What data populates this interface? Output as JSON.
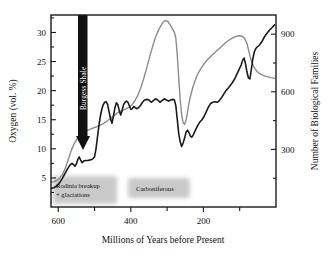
{
  "chart_data": {
    "type": "line",
    "title": "",
    "xlabel": "Millions of Years before Present",
    "ylabel": "Oxygen (vol. %)",
    "y2label": "Number of Biological Families",
    "xlim": [
      620,
      0
    ],
    "ylim": [
      0,
      33
    ],
    "y2lim": [
      0,
      1000
    ],
    "x_ticks": [
      600,
      400,
      200
    ],
    "x_tick_labels": [
      "600",
      "400",
      "200"
    ],
    "x_minor_ticks": [
      500,
      300,
      100
    ],
    "y_ticks": [
      5,
      10,
      15,
      20,
      25,
      30
    ],
    "y_tick_labels": [
      "5",
      "10",
      "15",
      "20",
      "25",
      "30"
    ],
    "y2_ticks": [
      300,
      600,
      900
    ],
    "y2_tick_labels": [
      "300",
      "600",
      "900"
    ],
    "y2_minor_ticks": [
      150,
      450,
      750,
      1050
    ],
    "grid": false,
    "legend_position": "none",
    "series": [
      {
        "name": "Oxygen (vol. %)",
        "axis": "left",
        "color": "#1a1a1a",
        "width": 1.6,
        "points": [
          [
            620,
            3.2
          ],
          [
            612,
            3.3
          ],
          [
            604,
            3.6
          ],
          [
            596,
            4.2
          ],
          [
            588,
            5.0
          ],
          [
            580,
            5.9
          ],
          [
            574,
            6.6
          ],
          [
            568,
            7.2
          ],
          [
            562,
            7.5
          ],
          [
            558,
            7.3
          ],
          [
            554,
            7.0
          ],
          [
            550,
            7.4
          ],
          [
            546,
            8.2
          ],
          [
            542,
            8.6
          ],
          [
            538,
            8.0
          ],
          [
            534,
            7.6
          ],
          [
            530,
            7.9
          ],
          [
            524,
            8.0
          ],
          [
            518,
            8.0
          ],
          [
            512,
            8.1
          ],
          [
            506,
            8.2
          ],
          [
            500,
            8.6
          ],
          [
            496,
            10.0
          ],
          [
            492,
            12.0
          ],
          [
            488,
            14.0
          ],
          [
            484,
            15.6
          ],
          [
            480,
            16.8
          ],
          [
            476,
            17.6
          ],
          [
            472,
            18.0
          ],
          [
            468,
            18.1
          ],
          [
            464,
            17.6
          ],
          [
            460,
            16.4
          ],
          [
            456,
            15.2
          ],
          [
            452,
            14.4
          ],
          [
            448,
            15.6
          ],
          [
            444,
            17.0
          ],
          [
            440,
            17.9
          ],
          [
            436,
            17.6
          ],
          [
            432,
            16.6
          ],
          [
            428,
            15.8
          ],
          [
            424,
            16.6
          ],
          [
            420,
            17.6
          ],
          [
            416,
            18.0
          ],
          [
            412,
            18.2
          ],
          [
            408,
            18.0
          ],
          [
            404,
            17.4
          ],
          [
            400,
            16.8
          ],
          [
            396,
            16.9
          ],
          [
            392,
            17.3
          ],
          [
            388,
            17.1
          ],
          [
            384,
            16.9
          ],
          [
            380,
            17.0
          ],
          [
            374,
            17.4
          ],
          [
            368,
            18.0
          ],
          [
            362,
            18.4
          ],
          [
            356,
            18.5
          ],
          [
            350,
            18.4
          ],
          [
            344,
            18.0
          ],
          [
            338,
            18.3
          ],
          [
            332,
            18.6
          ],
          [
            326,
            18.4
          ],
          [
            320,
            18.0
          ],
          [
            314,
            18.3
          ],
          [
            308,
            18.6
          ],
          [
            302,
            18.4
          ],
          [
            296,
            18.2
          ],
          [
            290,
            18.4
          ],
          [
            284,
            18.5
          ],
          [
            280,
            18.4
          ],
          [
            276,
            17.4
          ],
          [
            272,
            15.0
          ],
          [
            268,
            12.6
          ],
          [
            264,
            11.2
          ],
          [
            260,
            10.4
          ],
          [
            256,
            11.0
          ],
          [
            252,
            11.8
          ],
          [
            248,
            12.8
          ],
          [
            244,
            13.2
          ],
          [
            240,
            12.8
          ],
          [
            236,
            12.2
          ],
          [
            232,
            12.0
          ],
          [
            228,
            12.4
          ],
          [
            222,
            13.2
          ],
          [
            216,
            14.0
          ],
          [
            210,
            14.6
          ],
          [
            204,
            15.0
          ],
          [
            198,
            15.6
          ],
          [
            192,
            16.4
          ],
          [
            186,
            17.2
          ],
          [
            180,
            17.8
          ],
          [
            174,
            18.0
          ],
          [
            168,
            18.1
          ],
          [
            162,
            18.0
          ],
          [
            156,
            18.3
          ],
          [
            150,
            18.8
          ],
          [
            144,
            19.4
          ],
          [
            138,
            20.0
          ],
          [
            132,
            20.4
          ],
          [
            126,
            20.9
          ],
          [
            120,
            21.4
          ],
          [
            114,
            22.0
          ],
          [
            108,
            22.8
          ],
          [
            102,
            23.6
          ],
          [
            96,
            24.4
          ],
          [
            92,
            25.2
          ],
          [
            88,
            25.6
          ],
          [
            84,
            24.6
          ],
          [
            80,
            23.2
          ],
          [
            76,
            22.2
          ],
          [
            72,
            22.0
          ],
          [
            68,
            23.6
          ],
          [
            64,
            25.4
          ],
          [
            60,
            26.6
          ],
          [
            56,
            27.2
          ],
          [
            52,
            27.5
          ],
          [
            46,
            27.8
          ],
          [
            40,
            28.3
          ],
          [
            34,
            29.0
          ],
          [
            28,
            29.6
          ],
          [
            22,
            30.1
          ],
          [
            16,
            30.5
          ],
          [
            10,
            30.9
          ],
          [
            4,
            31.3
          ]
        ]
      },
      {
        "name": "Number of Biological Families",
        "axis": "right",
        "color": "#8c8c8c",
        "width": 1.4,
        "points": [
          [
            620,
            130
          ],
          [
            612,
            132
          ],
          [
            604,
            138
          ],
          [
            596,
            150
          ],
          [
            588,
            170
          ],
          [
            580,
            205
          ],
          [
            572,
            250
          ],
          [
            564,
            295
          ],
          [
            556,
            330
          ],
          [
            548,
            355
          ],
          [
            540,
            375
          ],
          [
            532,
            388
          ],
          [
            524,
            396
          ],
          [
            516,
            402
          ],
          [
            508,
            408
          ],
          [
            500,
            414
          ],
          [
            492,
            420
          ],
          [
            484,
            426
          ],
          [
            476,
            434
          ],
          [
            468,
            444
          ],
          [
            460,
            456
          ],
          [
            452,
            468
          ],
          [
            444,
            480
          ],
          [
            436,
            492
          ],
          [
            428,
            500
          ],
          [
            420,
            506
          ],
          [
            412,
            512
          ],
          [
            404,
            520
          ],
          [
            396,
            534
          ],
          [
            388,
            556
          ],
          [
            380,
            586
          ],
          [
            372,
            624
          ],
          [
            364,
            672
          ],
          [
            356,
            726
          ],
          [
            348,
            782
          ],
          [
            340,
            836
          ],
          [
            332,
            884
          ],
          [
            324,
            920
          ],
          [
            316,
            948
          ],
          [
            310,
            966
          ],
          [
            304,
            972
          ],
          [
            298,
            966
          ],
          [
            292,
            950
          ],
          [
            286,
            930
          ],
          [
            280,
            910
          ],
          [
            276,
            880
          ],
          [
            272,
            790
          ],
          [
            268,
            670
          ],
          [
            264,
            560
          ],
          [
            260,
            480
          ],
          [
            256,
            440
          ],
          [
            252,
            430
          ],
          [
            248,
            450
          ],
          [
            244,
            492
          ],
          [
            240,
            540
          ],
          [
            234,
            590
          ],
          [
            228,
            630
          ],
          [
            222,
            664
          ],
          [
            216,
            690
          ],
          [
            210,
            712
          ],
          [
            204,
            730
          ],
          [
            198,
            746
          ],
          [
            192,
            760
          ],
          [
            186,
            772
          ],
          [
            180,
            784
          ],
          [
            172,
            798
          ],
          [
            164,
            812
          ],
          [
            156,
            826
          ],
          [
            148,
            840
          ],
          [
            140,
            854
          ],
          [
            132,
            866
          ],
          [
            124,
            876
          ],
          [
            116,
            884
          ],
          [
            108,
            890
          ],
          [
            100,
            892
          ],
          [
            92,
            888
          ],
          [
            86,
            876
          ],
          [
            80,
            852
          ],
          [
            76,
            820
          ],
          [
            72,
            790
          ],
          [
            68,
            762
          ],
          [
            64,
            740
          ],
          [
            58,
            720
          ],
          [
            52,
            706
          ],
          [
            46,
            696
          ],
          [
            38,
            688
          ],
          [
            30,
            682
          ],
          [
            22,
            678
          ],
          [
            14,
            674
          ],
          [
            4,
            670
          ]
        ]
      }
    ],
    "annotations": [
      {
        "id": "burgess-shale",
        "text": "Burgess Shale",
        "x": 545,
        "style": "black-vertical-bar-with-arrow"
      },
      {
        "id": "rodinia",
        "text_line1": "Rodinia breakup",
        "text_line2": "+ glaciations",
        "x": 590,
        "style": "gray-shaded-box"
      },
      {
        "id": "carboniferous",
        "text_line1": "Carboniferous",
        "x": 345,
        "style": "gray-shaded-box"
      }
    ]
  },
  "colors": {
    "oxygen_curve": "#1a1a1a",
    "families_curve": "#8c8c8c",
    "frame": "#1a1a1a",
    "annotation_box": "#c9c9c9",
    "burgess_bar": "#111111",
    "background": "#ffffff"
  }
}
